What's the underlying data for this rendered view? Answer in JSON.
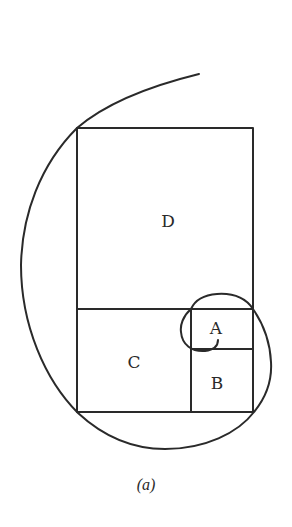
{
  "figure": {
    "caption": "(a)",
    "stroke_color": "#2a2a2a",
    "background": "#ffffff",
    "regions": [
      {
        "id": "D",
        "label": "D",
        "x": 77,
        "y": 128,
        "w": 176,
        "h": 181,
        "label_x": 168,
        "label_y": 221
      },
      {
        "id": "C",
        "label": "C",
        "x": 77,
        "y": 309,
        "w": 114,
        "h": 103,
        "label_x": 134,
        "label_y": 362
      },
      {
        "id": "A",
        "label": "A",
        "x": 191,
        "y": 309,
        "w": 62,
        "h": 40,
        "label_x": 216,
        "label_y": 328
      },
      {
        "id": "B",
        "label": "B",
        "x": 191,
        "y": 349,
        "w": 62,
        "h": 63,
        "label_x": 217,
        "label_y": 383
      }
    ],
    "spiral": {
      "description": "Continuous spiral curve passing through the corners of the nested squares D, C, B, A",
      "start": [
        199,
        74
      ],
      "end": [
        218,
        340
      ]
    }
  }
}
